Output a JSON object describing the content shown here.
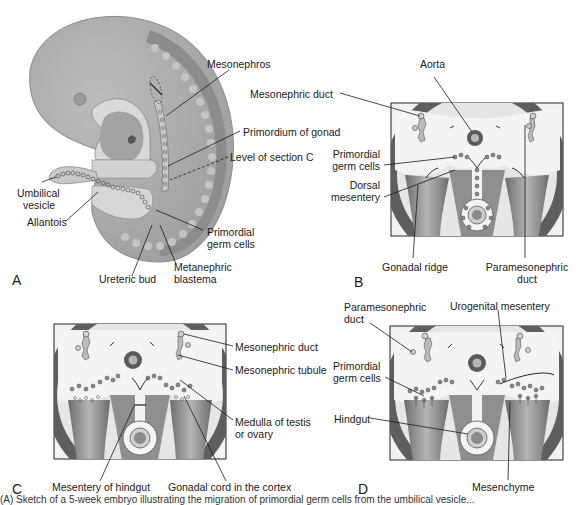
{
  "figure": {
    "panels": {
      "A": {
        "letter": "A",
        "title": "Embryo sketch (lateral view)",
        "labels": {
          "mesonephros": "Mesonephros",
          "primordium_of_gonad": "Primordium of gonad",
          "level_of_section": "Level of section C",
          "umbilical_vesicle_1": "Umbilical",
          "umbilical_vesicle_2": "vesicle",
          "allantois": "Allantois",
          "primordial_germ_cells_1": "Primordial",
          "primordial_germ_cells_2": "germ cells",
          "ureteric_bud": "Ureteric bud",
          "metanephric_blastema_1": "Metanephric",
          "metanephric_blastema_2": "blastema"
        }
      },
      "B": {
        "letter": "B",
        "labels": {
          "aorta": "Aorta",
          "mesonephric_duct": "Mesonephric duct",
          "primordial_germ_cells_1": "Primordial",
          "primordial_germ_cells_2": "germ cells",
          "dorsal_mesentery_1": "Dorsal",
          "dorsal_mesentery_2": "mesentery",
          "gonadal_ridge": "Gonadal ridge",
          "paramesonephric_duct_1": "Paramesonephric",
          "paramesonephric_duct_2": "duct"
        }
      },
      "C": {
        "letter": "C",
        "labels": {
          "mesonephric_duct": "Mesonephric duct",
          "mesonephric_tubule": "Mesonephric tubule",
          "medulla_1": "Medulla of testis",
          "medulla_2": "or ovary",
          "mesentery_of_hindgut": "Mesentery of hindgut",
          "gonadal_cord": "Gonadal cord in the cortex"
        }
      },
      "D": {
        "letter": "D",
        "labels": {
          "paramesonephric_duct_1": "Paramesonephric",
          "paramesonephric_duct_2": "duct",
          "urogenital_mesentery": "Urogenital mesentery",
          "primordial_germ_cells_1": "Primordial",
          "primordial_germ_cells_2": "germ cells",
          "hindgut": "Hindgut",
          "mesenchyme": "Mesenchyme"
        }
      }
    },
    "caption_fragment": "(A) Sketch of a 5-week embryo illustrating the migration of primordial germ cells from the umbilical vesicle...",
    "colors": {
      "embryo_body": "#a9a9a9",
      "embryo_dark": "#7d7d7d",
      "somites": "#bdbdbd",
      "section_light": "#e8e8e8",
      "section_mid": "#9a9a9a",
      "section_dark": "#5e5e5e",
      "leader_line": "#1a1a1a"
    }
  }
}
